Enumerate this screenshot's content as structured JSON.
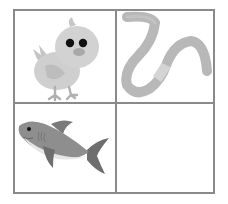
{
  "grid": {
    "rows": 2,
    "columns": 2,
    "border_color": "#8a8a8a",
    "background_color": "#ffffff",
    "cells": [
      {
        "position": "top-left",
        "content": "chick",
        "label": "Chick"
      },
      {
        "position": "top-right",
        "content": "worm",
        "label": "Worm"
      },
      {
        "position": "bottom-left",
        "content": "shark",
        "label": "Shark"
      },
      {
        "position": "bottom-right",
        "content": "empty",
        "label": ""
      }
    ]
  },
  "colors": {
    "chick_body": "#cfcfcf",
    "chick_wing": "#bdbdbd",
    "chick_eye": "#111111",
    "chick_beak": "#a9a9a9",
    "chick_feet": "#b0b0b0",
    "worm_body": "#b8b8b8",
    "worm_band": "#d4d4d4",
    "shark_body": "#8e8e8e",
    "shark_belly": "#e6e6e6",
    "shark_fin": "#6e6e6e"
  }
}
